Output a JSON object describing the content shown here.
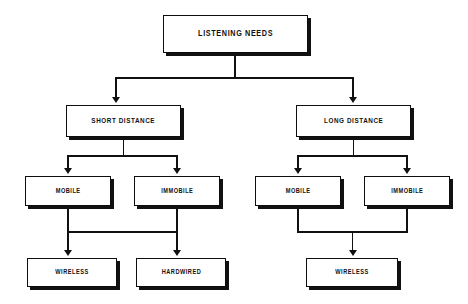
{
  "diagram": {
    "background_color": "#ffffff",
    "line_color": "#111111",
    "box_fill": "#ffffff",
    "shadow_color": "#111111",
    "nodes": {
      "root": "LISTENING NEEDS",
      "short_distance": "SHORT DISTANCE",
      "long_distance": "LONG DISTANCE",
      "short_mobile": "MOBILE",
      "short_immobile": "IMMOBILE",
      "long_mobile": "MOBILE",
      "long_immobile": "IMMOBILE",
      "short_wireless": "WIRELESS",
      "short_hardwired": "HARDWIRED",
      "long_wireless": "WIRELESS"
    }
  }
}
